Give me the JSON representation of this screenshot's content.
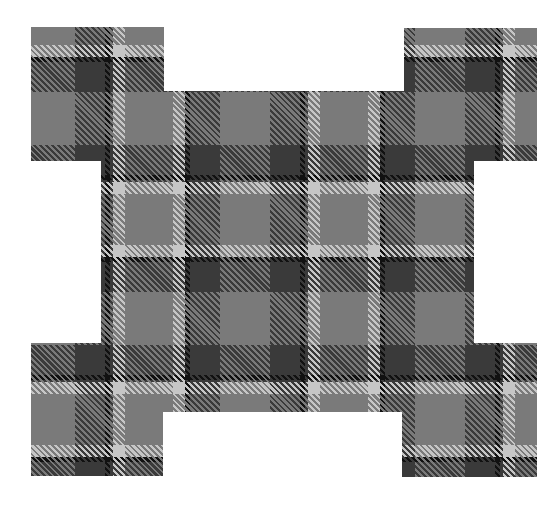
{
  "image": {
    "subject": "tartan-plaid-cross-shape",
    "background_color": "#ffffff",
    "palette": {
      "black": "#111111",
      "dark": "#3a3a3a",
      "mid": "#7a7a7a",
      "light": "#c6c6c6"
    },
    "pieces": [
      {
        "name": "top-left-block",
        "x": 31,
        "y": 27,
        "w": 133,
        "h": 134
      },
      {
        "name": "top-right-block",
        "x": 404,
        "y": 28,
        "w": 133,
        "h": 133
      },
      {
        "name": "main-body",
        "x": 101,
        "y": 91,
        "w": 373,
        "h": 321
      },
      {
        "name": "bottom-left-block",
        "x": 31,
        "y": 343,
        "w": 132,
        "h": 133
      },
      {
        "name": "bottom-right-block",
        "x": 402,
        "y": 343,
        "w": 135,
        "h": 134
      }
    ]
  }
}
